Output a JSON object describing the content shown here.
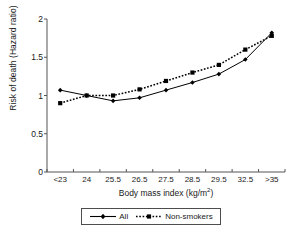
{
  "chart_data": {
    "type": "line",
    "title": "",
    "xlabel": "Body mass index (kg/m2)",
    "xlabel_base": "Body mass index (kg/m",
    "xlabel_exp": "2",
    "xlabel_close": ")",
    "ylabel": "Risk of death (Hazard ratio)",
    "categories": [
      "<23",
      "24",
      "25.5",
      "26.5",
      "27.5",
      "28.5",
      "29.5",
      "32.5",
      ">35"
    ],
    "ylim": [
      0,
      2
    ],
    "yticks": [
      "0",
      "0.5",
      "1",
      "1.5",
      "2"
    ],
    "ytick_values": [
      0,
      0.5,
      1,
      1.5,
      2
    ],
    "grid": false,
    "legend_position": "bottom-center",
    "series": [
      {
        "name": "All",
        "style": "solid",
        "marker": "diamond",
        "color": "#000000",
        "values": [
          1.07,
          1.0,
          0.93,
          0.97,
          1.07,
          1.17,
          1.28,
          1.47,
          1.82
        ]
      },
      {
        "name": "Non-smokers",
        "style": "dotted",
        "marker": "square",
        "color": "#000000",
        "values": [
          0.9,
          1.0,
          1.0,
          1.08,
          1.19,
          1.3,
          1.4,
          1.6,
          1.78
        ]
      }
    ]
  },
  "axis": {
    "color": "#555555"
  }
}
